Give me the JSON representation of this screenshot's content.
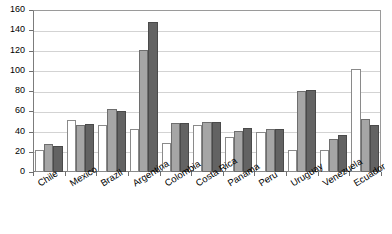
{
  "chart_data": {
    "type": "bar",
    "title": "",
    "subtitle": "",
    "xlabel": "",
    "ylabel": "",
    "ylim": [
      0,
      160
    ],
    "ytick_step": 20,
    "yticks": [
      0,
      20,
      40,
      60,
      80,
      100,
      120,
      140,
      160
    ],
    "grid": true,
    "legend": "none",
    "categories": [
      "Chile",
      "Mexico",
      "Brazil",
      "Argentina",
      "Colombia",
      "Costa Rica",
      "Panama",
      "Peru",
      "Uruguay",
      "Venezuela",
      "Ecuador"
    ],
    "series": [
      {
        "name": "series-1",
        "color": "#ffffff",
        "values": [
          22,
          51,
          46,
          42,
          29,
          46,
          35,
          40,
          22,
          22,
          102
        ]
      },
      {
        "name": "series-2",
        "color": "#a6a6a6",
        "values": [
          28,
          46,
          62,
          121,
          48,
          49,
          41,
          42,
          80,
          33,
          52
        ]
      },
      {
        "name": "series-3",
        "color": "#636363",
        "values": [
          26,
          47,
          60,
          148,
          48,
          49,
          43,
          42,
          81,
          37,
          46
        ]
      }
    ]
  }
}
